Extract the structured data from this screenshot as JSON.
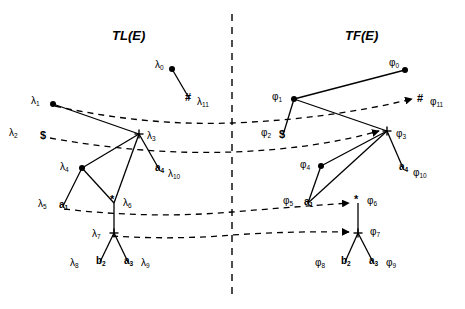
{
  "figure": {
    "background": "#ffffff",
    "ink": "#000000",
    "panels": [
      {
        "id": "left",
        "title": "TL(E)",
        "title_x": 112,
        "title_y": 28
      },
      {
        "id": "right",
        "title": "TF(E)",
        "title_x": 345,
        "title_y": 28
      }
    ],
    "divider": {
      "x": 232,
      "y1": 14,
      "y2": 296,
      "style": "dashed"
    }
  },
  "left_panel": {
    "nodes": [
      {
        "name": "lambda-0",
        "label": "λ",
        "sub": "0",
        "glyph": "dot",
        "x": 172,
        "y": 69,
        "lx": 155,
        "ly": 60
      },
      {
        "name": "lambda-11",
        "label": "λ",
        "sub": "11",
        "glyph": "#",
        "x": 189,
        "y": 98,
        "lx": 197,
        "ly": 97
      },
      {
        "name": "lambda-1",
        "label": "λ",
        "sub": "1",
        "glyph": "dot",
        "x": 53,
        "y": 104,
        "lx": 31,
        "ly": 96
      },
      {
        "name": "lambda-2",
        "label": "λ",
        "sub": "2",
        "glyph": "$",
        "x": 44,
        "y": 136,
        "lx": 9,
        "ly": 128
      },
      {
        "name": "lambda-3",
        "label": "λ",
        "sub": "3",
        "glyph": "+",
        "x": 139,
        "y": 134,
        "lx": 147,
        "ly": 131
      },
      {
        "name": "lambda-10",
        "label": "λ",
        "sub": "10",
        "glyph": "a",
        "glyph_sub": "4",
        "x": 159,
        "y": 169,
        "lx": 168,
        "ly": 169
      },
      {
        "name": "lambda-4",
        "label": "λ",
        "sub": "4",
        "glyph": "dot",
        "x": 82,
        "y": 168,
        "lx": 60,
        "ly": 162
      },
      {
        "name": "lambda-5",
        "label": "λ",
        "sub": "5",
        "glyph": "a",
        "glyph_sub": "1",
        "x": 63,
        "y": 206,
        "lx": 38,
        "ly": 199
      },
      {
        "name": "lambda-6",
        "label": "λ",
        "sub": "6",
        "glyph": "*",
        "x": 114,
        "y": 203,
        "lx": 123,
        "ly": 198
      },
      {
        "name": "lambda-7",
        "label": "λ",
        "sub": "7",
        "glyph": "+",
        "x": 114,
        "y": 233,
        "lx": 92,
        "ly": 229
      },
      {
        "name": "lambda-8",
        "label": "λ",
        "sub": "8",
        "glyph": "b",
        "glyph_sub": "2",
        "x": 100,
        "y": 262,
        "lx": 70,
        "ly": 258
      },
      {
        "name": "lambda-9",
        "label": "λ",
        "sub": "9",
        "glyph": "a",
        "glyph_sub": "3",
        "x": 128,
        "y": 262,
        "lx": 141,
        "ly": 258
      }
    ],
    "solid_edges": [
      {
        "from": "lambda-0",
        "to": "lambda-11"
      },
      {
        "from": "lambda-1",
        "to": "lambda-3"
      },
      {
        "from": "lambda-3",
        "to": "lambda-10"
      },
      {
        "from": "lambda-3",
        "to": "lambda-4"
      },
      {
        "from": "lambda-3",
        "to": "lambda-6"
      },
      {
        "from": "lambda-4",
        "to": "lambda-5"
      },
      {
        "from": "lambda-4",
        "to": "lambda-6"
      },
      {
        "from": "lambda-6",
        "to": "lambda-7"
      },
      {
        "from": "lambda-7",
        "to": "lambda-8"
      },
      {
        "from": "lambda-7",
        "to": "lambda-9"
      }
    ]
  },
  "right_panel": {
    "nodes": [
      {
        "name": "phi-0",
        "label": "φ",
        "sub": "0",
        "glyph": "dot",
        "x": 405,
        "y": 70,
        "lx": 389,
        "ly": 58
      },
      {
        "name": "phi-11",
        "label": "φ",
        "sub": "11",
        "glyph": "#",
        "x": 421,
        "y": 99,
        "lx": 430,
        "ly": 97
      },
      {
        "name": "phi-1",
        "label": "φ",
        "sub": "1",
        "glyph": "dot",
        "x": 294,
        "y": 99,
        "lx": 272,
        "ly": 92
      },
      {
        "name": "phi-2",
        "label": "φ",
        "sub": "2",
        "glyph": "$",
        "x": 283,
        "y": 135,
        "lx": 261,
        "ly": 128
      },
      {
        "name": "phi-3",
        "label": "φ",
        "sub": "3",
        "glyph": "+",
        "x": 387,
        "y": 131,
        "lx": 396,
        "ly": 129
      },
      {
        "name": "phi-10",
        "label": "φ",
        "sub": "10",
        "glyph": "a",
        "glyph_sub": "4",
        "x": 403,
        "y": 168,
        "lx": 413,
        "ly": 168
      },
      {
        "name": "phi-4",
        "label": "φ",
        "sub": "4",
        "glyph": "dot",
        "x": 321,
        "y": 166,
        "lx": 300,
        "ly": 160
      },
      {
        "name": "phi-5",
        "label": "φ",
        "sub": "5",
        "glyph": "a",
        "glyph_sub": "1",
        "x": 308,
        "y": 203,
        "lx": 283,
        "ly": 196
      },
      {
        "name": "phi-6",
        "label": "φ",
        "sub": "6",
        "glyph": "*",
        "x": 358,
        "y": 203,
        "lx": 367,
        "ly": 196
      },
      {
        "name": "phi-7",
        "label": "φ",
        "sub": "7",
        "glyph": "+",
        "x": 358,
        "y": 233,
        "lx": 370,
        "ly": 227
      },
      {
        "name": "phi-8",
        "label": "φ",
        "sub": "8",
        "glyph": "b",
        "glyph_sub": "2",
        "x": 345,
        "y": 262,
        "lx": 315,
        "ly": 258
      },
      {
        "name": "phi-9",
        "label": "φ",
        "sub": "9",
        "glyph": "a",
        "glyph_sub": "3",
        "x": 373,
        "y": 262,
        "lx": 386,
        "ly": 258
      }
    ],
    "solid_edges": [
      {
        "from": "phi-1",
        "to": "phi-0"
      },
      {
        "from": "phi-1",
        "to": "phi-2"
      },
      {
        "from": "phi-1",
        "to": "phi-3"
      },
      {
        "from": "phi-3",
        "to": "phi-10"
      },
      {
        "from": "phi-3",
        "to": "phi-4"
      },
      {
        "from": "phi-3",
        "to": "phi-5"
      },
      {
        "from": "phi-4",
        "to": "phi-5"
      },
      {
        "from": "phi-6",
        "to": "phi-7"
      },
      {
        "from": "phi-7",
        "to": "phi-8"
      },
      {
        "from": "phi-7",
        "to": "phi-9"
      }
    ]
  },
  "correspondence_curves": [
    {
      "name": "curve-lambda1-phi11",
      "path": "M 55 106 Q 145 126 232 123 Q 330 119 412 99",
      "arrow": true
    },
    {
      "name": "curve-lambda2-phi3",
      "path": "M 50 138 Q 145 155 232 152 Q 315 149 379 131",
      "arrow": true
    },
    {
      "name": "curve-a1-phi6",
      "path": "M 64 209 Q 150 219 232 212 Q 292 207 349 203",
      "arrow": true
    },
    {
      "name": "curve-lambda7-phi7",
      "path": "M 112 236 Q 175 240 232 235 Q 292 231 349 232",
      "arrow": true
    }
  ]
}
